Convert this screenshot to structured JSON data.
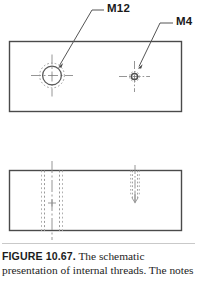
{
  "figure": {
    "labels": {
      "m12": "M12",
      "m4": "M4"
    },
    "caption": {
      "figure_number": "FIGURE 10.67.",
      "text": "The schematic presentation of internal threads. The notes"
    },
    "colors": {
      "outline": "#4a4a4a",
      "thread": "#8f8f8f",
      "hidden": "#9a9a9a",
      "center": "#8a8a8a",
      "leader": "#555555",
      "caption_rule": "#c9c9c9",
      "text": "#1d1d1d"
    },
    "views": [
      {
        "name": "front-view",
        "type": "rectangle-outline",
        "x": 9,
        "y": 41,
        "width": 173,
        "height": 71,
        "holes": [
          {
            "name": "m12-hole",
            "label": "M12",
            "type": "threaded-hole-circle",
            "cx": 52,
            "cy": 75,
            "minor_radius": 9.5,
            "major_radius": 12.5,
            "center_mark_length": 21
          },
          {
            "name": "m4-hole",
            "label": "M4",
            "type": "threaded-hole-circle",
            "cx": 134,
            "cy": 76,
            "minor_radius": 3.2,
            "major_radius": 5.0,
            "center_mark_length": 15
          }
        ]
      },
      {
        "name": "section-view",
        "type": "rectangle-outline",
        "x": 9,
        "y": 170,
        "width": 173,
        "height": 61,
        "holes": [
          {
            "name": "m12-hole-section",
            "label": "M12",
            "type": "hidden-threaded-hole",
            "cx": 52,
            "top": 170,
            "depth": 61,
            "minor_half_width": 7.5,
            "major_half_width": 10.5,
            "through": true,
            "centerline_extend": 9
          },
          {
            "name": "m4-hole-section",
            "label": "M4",
            "type": "hidden-threaded-hole",
            "cx": 135,
            "top": 170,
            "depth": 30,
            "minor_half_width": 2.6,
            "major_half_width": 4.2,
            "through": false,
            "centerline_extend": 5
          }
        ]
      }
    ],
    "leaders": [
      {
        "name": "m12-leader",
        "from_x": 105,
        "from_y": 10,
        "bend_x": 93,
        "bend_y": 10,
        "to_x": 58,
        "to_y": 66,
        "arrow": true
      },
      {
        "name": "m4-leader",
        "from_x": 174,
        "from_y": 23,
        "bend_x": 160,
        "bend_y": 23,
        "to_x": 138,
        "to_y": 67,
        "arrow": true
      }
    ]
  }
}
